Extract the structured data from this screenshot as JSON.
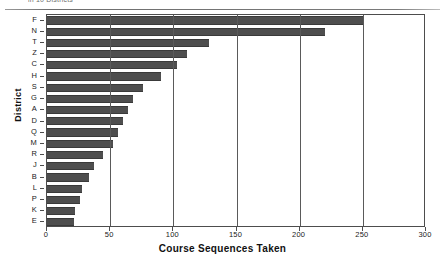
{
  "figure": {
    "top_caption": "in 10 Districts",
    "ytitle": "District",
    "xtitle": "Course Sequences Taken"
  },
  "chart_data": {
    "type": "bar",
    "orientation": "horizontal",
    "title": "",
    "subtitle": "",
    "xlabel": "Course Sequences Taken",
    "ylabel": "District",
    "categories": [
      "F",
      "N",
      "T",
      "Z",
      "C",
      "H",
      "S",
      "G",
      "A",
      "D",
      "Q",
      "M",
      "R",
      "J",
      "B",
      "L",
      "P",
      "K",
      "E"
    ],
    "values": [
      250,
      220,
      128,
      111,
      103,
      90,
      76,
      68,
      64,
      60,
      56,
      52,
      44,
      37,
      33,
      28,
      26,
      22,
      21
    ],
    "xlim": [
      0,
      300
    ],
    "xticks": [
      0,
      50,
      100,
      150,
      200,
      250,
      300
    ],
    "xtick_labels": [
      "0",
      "50",
      "100",
      "150",
      "200",
      "250",
      "300"
    ],
    "grid": "vertical",
    "legend": "none",
    "bar_color": "#4e4e4e",
    "axis_color": "#4d4d4d",
    "background": "#ffffff"
  }
}
